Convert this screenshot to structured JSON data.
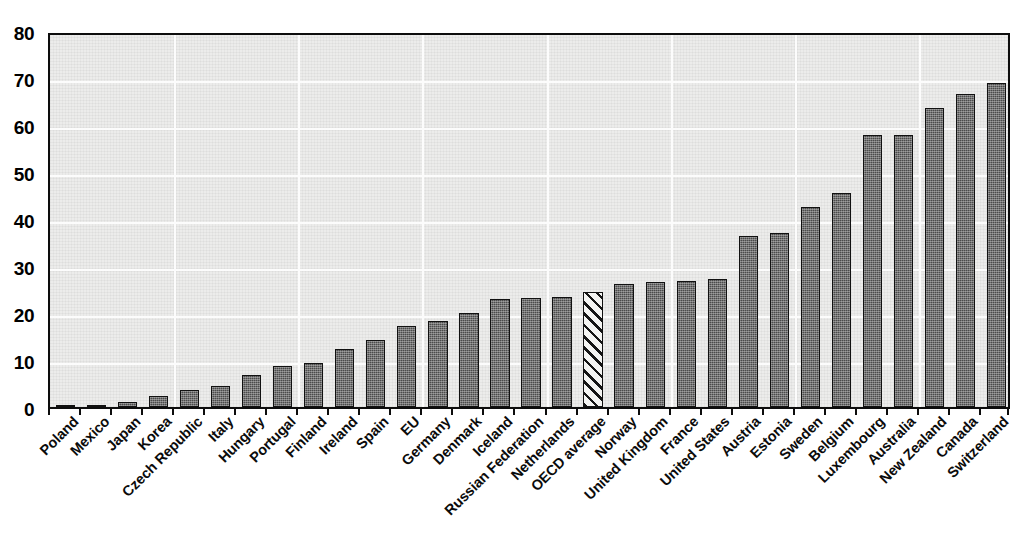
{
  "chart_data": {
    "type": "bar",
    "title": "",
    "subtitle": "",
    "xlabel": "",
    "ylabel": "",
    "ylim": [
      0,
      80
    ],
    "yticks": [
      0,
      10,
      20,
      30,
      40,
      50,
      60,
      70,
      80
    ],
    "ytick_labels": [
      "0",
      "10",
      "20",
      "30",
      "40",
      "50",
      "60",
      "70",
      "80"
    ],
    "grid": true,
    "legend": null,
    "highlight_category": "OECD average",
    "highlight_style": "hatched",
    "bar_color": "#4b4b4b",
    "bar_edge_color": "#111111",
    "plot_background": "#ececeb",
    "categories": [
      "Poland",
      "Mexico",
      "Japan",
      "Korea",
      "Czech Republic",
      "Italy",
      "Hungary",
      "Portugal",
      "Finland",
      "Ireland",
      "Spain",
      "EU",
      "Germany",
      "Denmark",
      "Iceland",
      "Russian Federation",
      "Netherlands",
      "OECD average",
      "Norway",
      "United Kingdom",
      "France",
      "United States",
      "Austria",
      "Estonia",
      "Sweden",
      "Belgium",
      "Luxembourg",
      "Australia",
      "New Zealand",
      "Canada",
      "Switzerland"
    ],
    "values": [
      0.4,
      0.4,
      1.1,
      2.4,
      3.7,
      4.4,
      6.9,
      8.8,
      9.4,
      12.4,
      14.2,
      17.3,
      18.3,
      20.1,
      23.0,
      23.2,
      23.5,
      24.5,
      26.2,
      26.7,
      26.9,
      27.2,
      36.4,
      37.1,
      42.6,
      45.5,
      57.9,
      57.9,
      63.7,
      66.6,
      68.9
    ]
  }
}
